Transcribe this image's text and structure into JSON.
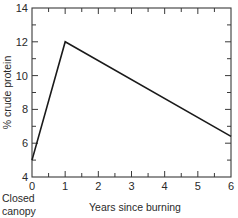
{
  "chart_data": {
    "type": "line",
    "title": "",
    "xlabel": "Years since burning",
    "ylabel": "% crude protein",
    "x": [
      0,
      1,
      6
    ],
    "series": [
      {
        "name": "crude protein",
        "values": [
          5,
          12,
          6.4
        ]
      }
    ],
    "xlim": [
      0,
      6
    ],
    "ylim": [
      4,
      14
    ],
    "x_ticks": [
      0,
      1,
      2,
      3,
      4,
      5,
      6
    ],
    "y_ticks": [
      4,
      6,
      8,
      10,
      12,
      14
    ],
    "x_tick_labels": [
      "0",
      "1",
      "2",
      "3",
      "4",
      "5",
      "6"
    ],
    "y_tick_labels": [
      "4",
      "6",
      "8",
      "10",
      "12",
      "14"
    ],
    "annotations": [
      "Closed canopy"
    ],
    "grid": false,
    "legend": "none"
  },
  "labels": {
    "xlabel": "Years since burning",
    "ylabel": "% crude protein",
    "annotation_line1": "Closed",
    "annotation_line2": "canopy"
  }
}
